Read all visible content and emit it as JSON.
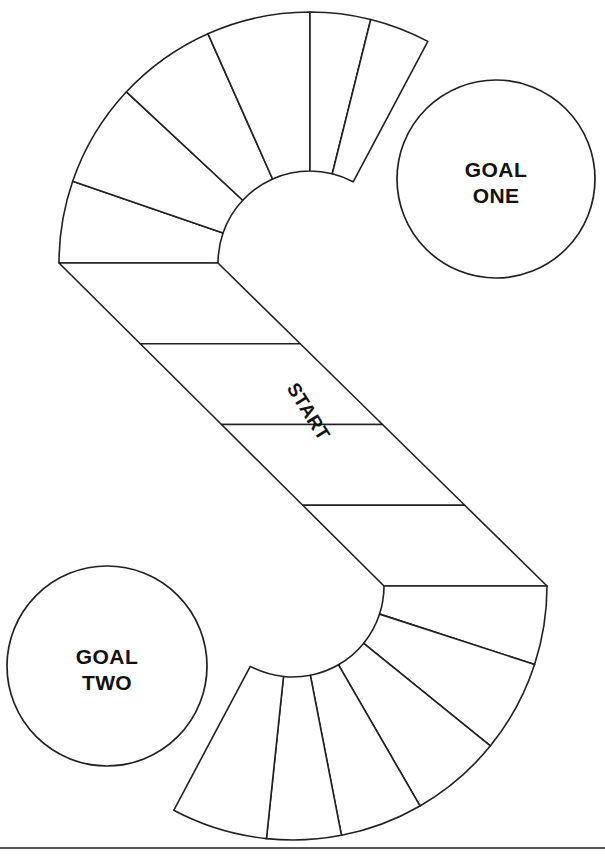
{
  "page": {
    "background_color": "#ffffff",
    "line_color": "#231f20",
    "text_color": "#111111",
    "width": 605,
    "height": 856
  },
  "board": {
    "shape": "s-curve-path",
    "start": {
      "label": "START",
      "rotation_deg": 58,
      "x": 303,
      "y": 415
    },
    "goals": [
      {
        "id": "goal-one",
        "line1": "GOAL",
        "line2": "ONE",
        "cx": 496,
        "cy": 179,
        "r": 99
      },
      {
        "id": "goal-two",
        "line1": "GOAL",
        "line2": "TWO",
        "cx": 107,
        "cy": 666,
        "r": 100
      }
    ],
    "upper_arc": {
      "cx": 310,
      "cy": 263,
      "r_outer": 251,
      "r_inner": 92,
      "start_angle_deg": 180,
      "end_angle_deg": 62,
      "segment_angles_deg": [
        180,
        161,
        137,
        114,
        90,
        76,
        62
      ]
    },
    "lower_arc": {
      "cx": 293,
      "cy": 586,
      "r_outer": 254,
      "r_inner": 91,
      "start_angle_deg": 0,
      "end_angle_deg": -118,
      "segment_angles_deg": [
        0,
        -18,
        -39,
        -60,
        -79,
        -96,
        -118
      ]
    },
    "middle_band": {
      "angle_deg": 58,
      "cell_count": 4
    },
    "base_rule": {
      "y": 848,
      "x1": 0,
      "x2": 605
    }
  }
}
